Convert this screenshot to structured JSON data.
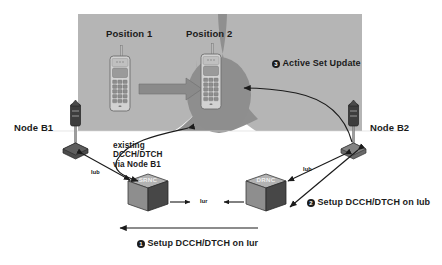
{
  "diagram": {
    "background_color": "#ffffff",
    "cell_color": "#b4b4b4",
    "cell_overlap_color": "#8f8f8f",
    "line_color": "#1b1b1b",
    "device_color": "#c9c9c9",
    "node_color": "#6e6e6e"
  },
  "positions": {
    "position1": "Position 1",
    "position2": "Position 2"
  },
  "nodes": {
    "node_b1": "Node B1",
    "node_b2": "Node B2",
    "srnc": "SRNC",
    "drnc": "DRNC"
  },
  "interfaces": {
    "iub_left": "Iub",
    "iub_right": "Iub",
    "iur": "Iur"
  },
  "annotations": {
    "existing_link": "existing\nDCCH/DTCH\nvia Node B1"
  },
  "steps": [
    {
      "number": "1",
      "label": "Setup DCCH/DTCH on Iur"
    },
    {
      "number": "2",
      "label": "Setup DCCH/DTCH on Iub"
    },
    {
      "number": "3",
      "label": "Active Set Update"
    }
  ],
  "icons": {
    "mobile_position1": "mobile-phone-icon",
    "mobile_position2": "mobile-phone-icon",
    "node_b1": "base-station-antenna-icon",
    "node_b2": "base-station-antenna-icon",
    "srnc": "rnc-cube-icon",
    "drnc": "rnc-cube-icon",
    "movement": "block-arrow-icon"
  }
}
